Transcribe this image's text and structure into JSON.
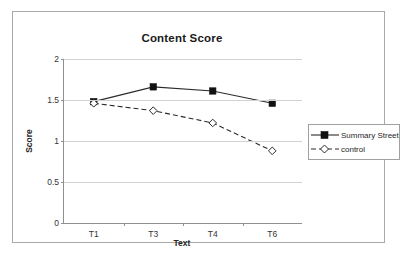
{
  "figure": {
    "scan_artifact_text": "· · ·· ·  ·· ·",
    "border_color": "#a9a9a9"
  },
  "chart_data": {
    "type": "line",
    "title": "Content Score",
    "xlabel": "Text",
    "ylabel": "Score",
    "categories": [
      "T1",
      "T3",
      "T4",
      "T6"
    ],
    "ylim": [
      0,
      2
    ],
    "yticks": [
      "0",
      "0.5",
      "1",
      "1.5",
      "2"
    ],
    "ytick_values": [
      0,
      0.5,
      1,
      1.5,
      2
    ],
    "grid": "horizontal",
    "legend_position": "right",
    "series": [
      {
        "name": "Summary Street",
        "values": [
          1.48,
          1.66,
          1.61,
          1.46
        ],
        "marker": "filled-square",
        "linestyle": "solid",
        "color": "#2b2b2b"
      },
      {
        "name": "control",
        "values": [
          1.46,
          1.37,
          1.22,
          0.88
        ],
        "marker": "open-diamond",
        "linestyle": "dashed",
        "color": "#2b2b2b"
      }
    ]
  }
}
